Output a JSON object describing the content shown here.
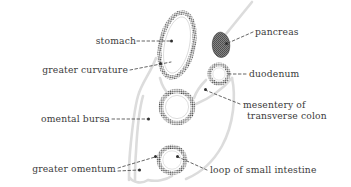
{
  "figure": {
    "kind": "anatomical-line-diagram",
    "background_color": "#ffffff",
    "ink_color": "#3b3b3b",
    "faint_membrane_color": "#d8d8d8",
    "pancreas_fill_color": "#6e6e6e"
  },
  "labels": {
    "stomach": "stomach",
    "greater_curvature": "greater curvature",
    "omental_bursa": "omental bursa",
    "greater_omentum": "greater omentum",
    "pancreas": "pancreas",
    "duodenum": "duodenum",
    "mesentery_line1": "mesentery of",
    "mesentery_line2": "transverse colon",
    "loop_of_small_intestine": "loop of small intestine"
  },
  "structures": {
    "stomach": "stomach-outline",
    "pancreas": "pancreas-shape",
    "duodenum": "duodenum-ring",
    "transverse_colon": "transverse-colon-ring",
    "small_intestine": "small-intestine-ring",
    "omental_bursa": "omental-bursa-membrane",
    "greater_omentum": "greater-omentum-membrane"
  }
}
